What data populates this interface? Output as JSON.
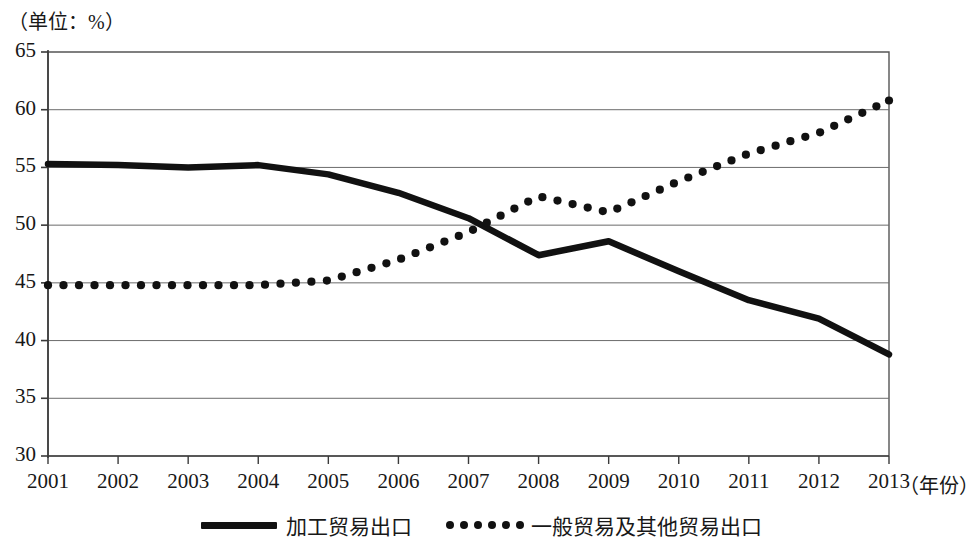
{
  "chart_data": {
    "type": "line",
    "title": "",
    "unit_note": "（单位：%）",
    "xlabel": "（年份）",
    "ylabel": "",
    "grid": true,
    "legend_position": "bottom",
    "xlim": [
      2001,
      2013
    ],
    "ylim": [
      30,
      65
    ],
    "ytick_labels": [
      "65",
      "60",
      "55",
      "50",
      "45",
      "40",
      "35",
      "30"
    ],
    "yticks": [
      65,
      60,
      55,
      50,
      45,
      40,
      35,
      30
    ],
    "xtick_labels": [
      "2001",
      "2002",
      "2003",
      "2004",
      "2005",
      "2006",
      "2007",
      "2008",
      "2009",
      "2010",
      "2011",
      "2012",
      "2013"
    ],
    "categories": [
      2001,
      2002,
      2003,
      2004,
      2005,
      2006,
      2007,
      2008,
      2009,
      2010,
      2011,
      2012,
      2013
    ],
    "series": [
      {
        "name": "加工贸易出口",
        "style": "solid",
        "color": "#111111",
        "values": [
          55.3,
          55.2,
          55.0,
          55.2,
          54.4,
          52.8,
          50.6,
          47.4,
          48.6,
          46.0,
          43.5,
          41.9,
          38.8
        ]
      },
      {
        "name": "一般贸易及其他贸易出口",
        "style": "dotted",
        "color": "#111111",
        "values": [
          44.8,
          44.8,
          44.8,
          44.8,
          45.2,
          47.0,
          49.4,
          52.5,
          51.1,
          53.8,
          56.2,
          58.0,
          60.8
        ]
      }
    ],
    "annotations": {
      "crossover_year_approx": 2007.6,
      "crossover_value_approx": 50.2
    }
  },
  "legend": {
    "items": [
      {
        "label": "加工贸易出口",
        "marker": "solid-line-swatch"
      },
      {
        "label": "一般贸易及其他贸易出口",
        "marker": "dotted-line-swatch"
      }
    ]
  }
}
